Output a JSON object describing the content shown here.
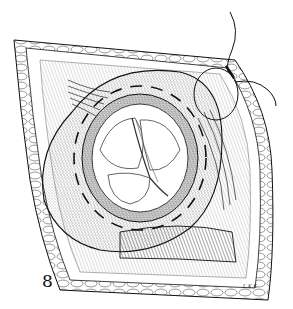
{
  "figure": {
    "number": "8",
    "artist_initials": "L.K.K.",
    "colors": {
      "ink": "#111111",
      "paper": "#ffffff",
      "stipple": "#555555"
    }
  }
}
